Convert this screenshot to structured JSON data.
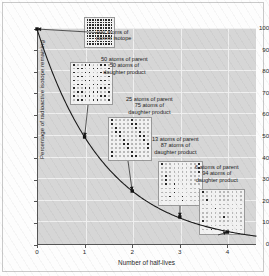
{
  "chart_data": {
    "type": "line",
    "title": "",
    "xlabel": "Number of half-lives",
    "ylabel": "Percentage of radioactive isotope remaining",
    "xlim": [
      0,
      4.6
    ],
    "ylim": [
      0,
      100
    ],
    "xticks": [
      "0",
      "1",
      "2",
      "3",
      "4"
    ],
    "xtick_values": [
      0,
      1,
      2,
      3,
      4
    ],
    "yticks": [
      "0",
      "10",
      "20",
      "30",
      "40",
      "50",
      "60",
      "70",
      "80",
      "90",
      "100"
    ],
    "ytick_values": [
      0,
      10,
      20,
      30,
      40,
      50,
      60,
      70,
      80,
      90,
      100
    ],
    "grid": true,
    "legend": "none",
    "series": [
      {
        "name": "Percentage of radioactive isotope remaining",
        "x": [
          0,
          1,
          2,
          3,
          4
        ],
        "values": [
          100,
          50,
          25,
          13,
          6
        ]
      }
    ],
    "markers": [
      {
        "x": 0,
        "y": 100
      },
      {
        "x": 1,
        "y": 50
      },
      {
        "x": 2,
        "y": 25
      },
      {
        "x": 3,
        "y": 13
      },
      {
        "x": 4,
        "y": 6
      }
    ],
    "annotations": [
      {
        "at_halflife": 0,
        "parent_atoms": 100,
        "daughter_atoms": 0,
        "lines": [
          "100 atoms of",
          "parent isotope"
        ]
      },
      {
        "at_halflife": 1,
        "parent_atoms": 50,
        "daughter_atoms": 50,
        "lines": [
          "50 atoms of parent",
          "50 atoms of",
          "daughter product"
        ]
      },
      {
        "at_halflife": 2,
        "parent_atoms": 25,
        "daughter_atoms": 75,
        "lines": [
          "25 atoms of parent",
          "75 atoms of",
          "daughter product"
        ]
      },
      {
        "at_halflife": 3,
        "parent_atoms": 13,
        "daughter_atoms": 87,
        "lines": [
          "13 atoms of parent",
          "87 atoms of",
          "daughter product"
        ]
      },
      {
        "at_halflife": 4,
        "parent_atoms": 6,
        "daughter_atoms": 94,
        "lines": [
          "6 atoms of parent",
          "94 atoms of",
          "daughter product"
        ]
      }
    ],
    "colors": {
      "plot_background": "#d6d6d6",
      "gridlines": "#efefef",
      "curve": "#1a1a1a",
      "parent_atom": "#2b2b2b",
      "daughter_atom": "#b9b9b9",
      "box_background": "#f2f2f2",
      "axis": "#555555",
      "text": "#1d1d1d"
    }
  }
}
